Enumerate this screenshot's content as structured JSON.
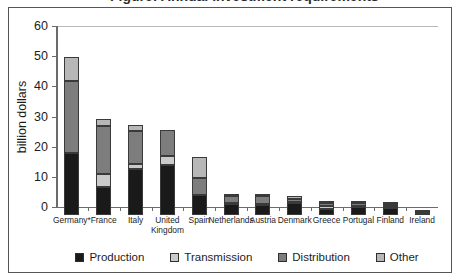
{
  "figure": {
    "cut_off_title": "Figure: Annual investment requirements",
    "background": "#ffffff",
    "frame_color": "#555555"
  },
  "chart_data": {
    "type": "bar",
    "stacked": true,
    "title": "",
    "xlabel": "",
    "ylabel": "billion dollars",
    "ylim": [
      0,
      60
    ],
    "yticks": [
      0,
      10,
      20,
      30,
      40,
      50,
      60
    ],
    "ytick_labels": [
      "0",
      "10",
      "20",
      "30",
      "40",
      "50",
      "60"
    ],
    "grid": false,
    "legend_position": "bottom-center",
    "categories": [
      "Germany*",
      "France",
      "Italy",
      "United\nKingdom",
      "Spain",
      "Netherlands",
      "Austria",
      "Denmark",
      "Greece",
      "Portugal",
      "Finland",
      "Ireland"
    ],
    "series": [
      {
        "name": "Production",
        "color": "#1a1a1a",
        "values": [
          20.3,
          9.2,
          15.2,
          16.3,
          6.6,
          3.5,
          3.3,
          3.7,
          1.7,
          2.4,
          2.3,
          0.2
        ]
      },
      {
        "name": "Transmission",
        "color": "#cacaca",
        "values": [
          0.0,
          4.2,
          1.6,
          3.0,
          0.0,
          0.4,
          0.3,
          0.4,
          1.1,
          0.5,
          0.4,
          0.2
        ]
      },
      {
        "name": "Distribution",
        "color": "#7d7d7d",
        "values": [
          23.8,
          16.0,
          10.8,
          8.6,
          5.4,
          2.3,
          2.6,
          1.2,
          1.0,
          0.8,
          0.9,
          0.4
        ]
      },
      {
        "name": "Other",
        "color": "#b7b7b7",
        "values": [
          8.2,
          2.4,
          2.2,
          0.0,
          7.2,
          0.5,
          0.5,
          0.7,
          0.5,
          0.5,
          0.4,
          0.2
        ]
      }
    ],
    "totals": [
      52.3,
      31.8,
      29.8,
      27.9,
      19.2,
      6.7,
      6.7,
      6.0,
      4.3,
      4.2,
      4.0,
      1.0
    ],
    "legend": [
      "Production",
      "Transmission",
      "Distribution",
      "Other"
    ]
  }
}
